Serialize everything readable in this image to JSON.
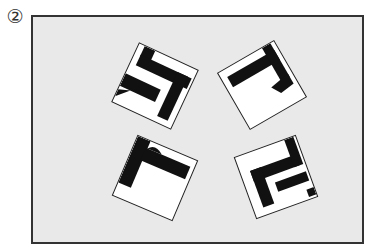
{
  "label": "②",
  "frame": {
    "background": "#e9e9e9",
    "border": "#333333"
  },
  "tiles": [
    {
      "name": "tile-top-left",
      "cx": 155,
      "cy": 86,
      "rotate": 25
    },
    {
      "name": "tile-top-right",
      "cx": 262,
      "cy": 85,
      "rotate": -30
    },
    {
      "name": "tile-bottom-left",
      "cx": 155,
      "cy": 178,
      "rotate": 23
    },
    {
      "name": "tile-bottom-right",
      "cx": 276,
      "cy": 177,
      "rotate": -20
    }
  ]
}
